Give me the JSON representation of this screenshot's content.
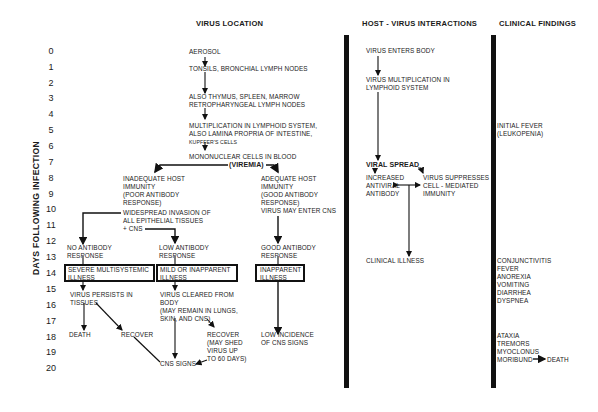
{
  "headers": {
    "virus_location": "VIRUS LOCATION",
    "host_virus": "HOST - VIRUS INTERACTIONS",
    "clinical": "CLINICAL FINDINGS"
  },
  "axis": {
    "label": "DAYS FOLLOWING INFECTION",
    "days": [
      "0",
      "1",
      "2",
      "3",
      "4",
      "5",
      "6",
      "7",
      "8",
      "9",
      "10",
      "11",
      "12",
      "13",
      "14",
      "15",
      "16",
      "17",
      "18",
      "19",
      "20"
    ]
  },
  "virus_location": {
    "aerosol": "AEROSOL",
    "tonsils": "TONSILS, BRONCHIAL LYMPH NODES",
    "thymus_1": "ALSO THYMUS, SPLEEN, MARROW",
    "thymus_2": "RETROPHARYNGEAL LYMPH NODES",
    "mult_1": "MULTIPLICATION IN LYMPHOID SYSTEM,",
    "mult_2": "ALSO LAMINA PROPRIA OF INTESTINE,",
    "mult_3": "KUPFFER'S CELLS",
    "mono": "MONONUCLEAR CELLS IN BLOOD",
    "viremia": "(VIREMIA)",
    "inadequate_1": "INADEQUATE HOST",
    "inadequate_2": "IMMUNITY",
    "inadequate_3": "(POOR ANTIBODY",
    "inadequate_4": "RESPONSE)",
    "widespread_1": "WIDESPREAD INVASION OF",
    "widespread_2": "ALL EPITHELIAL TISSUES",
    "widespread_3": "+ CNS",
    "adequate_1": "ADEQUATE HOST",
    "adequate_2": "IMMUNITY",
    "adequate_3": "(GOOD ANTIBODY",
    "adequate_4": "RESPONSE)",
    "adequate_5": "VIRUS MAY ENTER CNS",
    "no_ab_1": "NO ANTIBODY",
    "no_ab_2": "RESPONSE",
    "low_ab_1": "LOW ANTIBODY",
    "low_ab_2": "RESPONSE",
    "good_ab_1": "GOOD ANTIBODY",
    "good_ab_2": "RESPONSE",
    "severe_1": "SEVERE MULTISYSTEMIC",
    "severe_2": "ILLNESS",
    "mild_1": "MILD OR INAPPARENT",
    "mild_2": "ILLNESS",
    "inapparent_1": "INAPPARENT",
    "inapparent_2": "ILLNESS",
    "persists_1": "VIRUS PERSISTS IN",
    "persists_2": "TISSUES",
    "cleared_1": "VIRUS CLEARED FROM",
    "cleared_2": "BODY",
    "cleared_3": "(MAY REMAIN IN LUNGS,",
    "cleared_4": "SKIN, AND CNS)",
    "death": "DEATH",
    "recover": "RECOVER",
    "recover2_1": "RECOVER",
    "recover2_2": "(MAY SHED",
    "recover2_3": "VIRUS UP",
    "recover2_4": "TO 60 DAYS)",
    "low_incidence_1": "LOW INCIDENCE",
    "low_incidence_2": "OF CNS SIGNS",
    "cns_signs": "CNS SIGNS"
  },
  "host_virus": {
    "enters": "VIRUS ENTERS BODY",
    "mult_1": "VIRUS MULTIPLICATION IN",
    "mult_2": "LYMPHOID SYSTEM",
    "viral_spread": "VIRAL SPREAD",
    "increased_1": "INCREASED",
    "increased_2": "ANTIVIRAL",
    "increased_3": "ANTIBODY",
    "suppresses_1": "VIRUS SUPPRESSES",
    "suppresses_2": "CELL - MEDIATED",
    "suppresses_3": "IMMUNITY",
    "clinical_illness": "CLINICAL ILLNESS"
  },
  "clinical": {
    "fever_1": "INITIAL FEVER",
    "fever_2": "(LEUKOPENIA)",
    "signs_a": [
      "CONJUNCTIVITIS",
      "FEVER",
      "ANOREXIA",
      "VOMITING",
      "DIARRHEA",
      "DYSPNEA"
    ],
    "signs_b": [
      "ATAXIA",
      "TREMORS",
      "MYOCLONUS"
    ],
    "moribund": "MORIBUND",
    "death": "DEATH"
  }
}
